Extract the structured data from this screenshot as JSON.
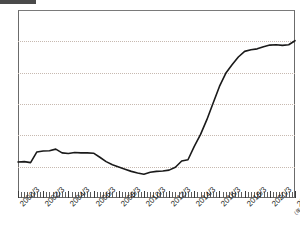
{
  "header": {
    "tag_label": "",
    "title": ""
  },
  "footer": {
    "source_note": ""
  },
  "chart_data": {
    "type": "line",
    "title": "",
    "xlabel": "",
    "ylabel": "",
    "x_unit_label": "(年/月)",
    "ylim": [
      0,
      60
    ],
    "y_ticks": [
      0,
      10,
      20,
      30,
      40,
      50,
      60
    ],
    "grid": true,
    "grid_axis": "y",
    "legend": "none",
    "line_color": "#1a1a1a",
    "x_tick_labels": [
      "2000/3",
      "2002/3",
      "2004/3",
      "2006/3",
      "2008/3",
      "2010/3",
      "2012/3",
      "2014/3",
      "2016/3",
      "2018/3",
      "2020/3",
      "2022/3"
    ],
    "x_tick_positions": [
      0,
      8,
      16,
      24,
      32,
      40,
      48,
      56,
      64,
      72,
      80,
      88
    ],
    "x_minor_tick_count": 89,
    "x": [
      "2000/3",
      "2000/9",
      "2001/3",
      "2001/9",
      "2002/3",
      "2002/9",
      "2003/3",
      "2003/9",
      "2004/3",
      "2004/9",
      "2005/3",
      "2005/9",
      "2006/3",
      "2006/9",
      "2007/3",
      "2007/9",
      "2008/3",
      "2008/9",
      "2009/3",
      "2009/9",
      "2010/3",
      "2010/9",
      "2011/3",
      "2011/9",
      "2012/3",
      "2012/9",
      "2013/3",
      "2013/9",
      "2014/3",
      "2014/9",
      "2015/3",
      "2015/9",
      "2016/3",
      "2016/9",
      "2017/3",
      "2017/9",
      "2018/3",
      "2018/9",
      "2019/3",
      "2019/9",
      "2020/3",
      "2020/9",
      "2021/3",
      "2021/9",
      "2022/3"
    ],
    "values": [
      11.5,
      11.6,
      11.3,
      14.7,
      15.0,
      15.1,
      15.6,
      14.4,
      14.2,
      14.5,
      14.4,
      14.4,
      14.3,
      13.0,
      11.6,
      10.6,
      9.9,
      9.2,
      8.5,
      8.0,
      7.6,
      8.2,
      8.5,
      8.6,
      8.9,
      9.8,
      11.8,
      12.2,
      16.5,
      20.3,
      25.0,
      30.3,
      35.6,
      39.8,
      42.5,
      45.0,
      46.8,
      47.3,
      47.6,
      48.3,
      48.8,
      48.9,
      48.7,
      48.9,
      50.2
    ]
  }
}
